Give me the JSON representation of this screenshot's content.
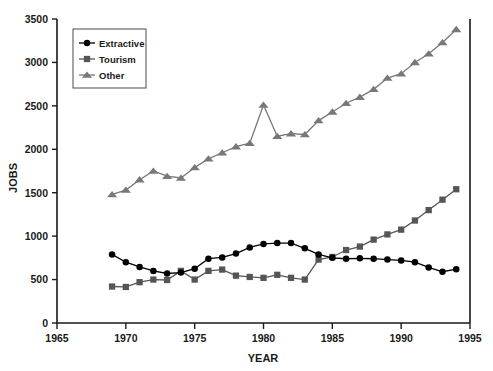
{
  "chart_data": {
    "type": "line",
    "title": "",
    "xlabel": "YEAR",
    "ylabel": "JOBS",
    "xlim": [
      1965,
      1995
    ],
    "ylim": [
      0,
      3500
    ],
    "xticks": [
      1965,
      1970,
      1975,
      1980,
      1985,
      1990,
      1995
    ],
    "yticks": [
      0,
      500,
      1000,
      1500,
      2000,
      2500,
      3000,
      3500
    ],
    "grid": false,
    "legend_position": "upper-left-inside",
    "x": [
      1969,
      1970,
      1971,
      1972,
      1973,
      1974,
      1975,
      1976,
      1977,
      1978,
      1979,
      1980,
      1981,
      1982,
      1983,
      1984,
      1985,
      1986,
      1987,
      1988,
      1989,
      1990,
      1991,
      1992,
      1993,
      1994
    ],
    "series": [
      {
        "name": "Extractive",
        "marker": "circle",
        "color": "#000000",
        "values": [
          790,
          700,
          645,
          600,
          570,
          580,
          625,
          740,
          755,
          800,
          870,
          910,
          920,
          920,
          860,
          790,
          750,
          740,
          745,
          740,
          730,
          720,
          700,
          640,
          590,
          620
        ]
      },
      {
        "name": "Tourism",
        "marker": "square",
        "color": "#555555",
        "values": [
          420,
          415,
          470,
          500,
          495,
          600,
          500,
          600,
          615,
          545,
          530,
          520,
          555,
          520,
          500,
          730,
          760,
          840,
          880,
          960,
          1020,
          1075,
          1180,
          1300,
          1420,
          1540
        ]
      },
      {
        "name": "Other",
        "marker": "triangle",
        "color": "#787878",
        "values": [
          1480,
          1530,
          1650,
          1750,
          1690,
          1670,
          1790,
          1890,
          1960,
          2030,
          2070,
          2510,
          2150,
          2180,
          2170,
          2330,
          2430,
          2530,
          2600,
          2690,
          2820,
          2870,
          3000,
          3100,
          3230,
          3380
        ]
      }
    ]
  },
  "legend": {
    "items": [
      {
        "label": "Extractive"
      },
      {
        "label": "Tourism"
      },
      {
        "label": "Other"
      }
    ]
  },
  "axes": {
    "x_title": "YEAR",
    "y_title": "JOBS"
  }
}
